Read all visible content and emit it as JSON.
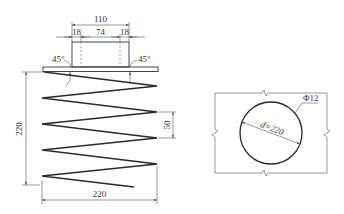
{
  "figure": {
    "left_view": {
      "name": "spring-elevation",
      "top_dimensions": {
        "overall_width": "110",
        "left_segment": "18",
        "middle_segment": "74",
        "right_segment": "18"
      },
      "weld_angles": {
        "left": "45°",
        "right": "45°"
      },
      "spring_height": "220",
      "pitch": "50",
      "spring_width": "220"
    },
    "right_view": {
      "name": "plan-section",
      "diameter_label": "d=220",
      "bar_label": "Φ12"
    }
  },
  "colors": {
    "line": "#2a2a2a",
    "background": "#ffffff"
  }
}
